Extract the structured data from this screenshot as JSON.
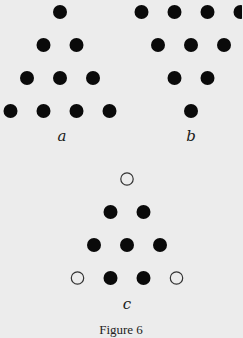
{
  "figure": {
    "caption": "Figure 6",
    "colors": {
      "filled": "#0a0a0a",
      "open_stroke": "#333333",
      "open_fill": "#ececec"
    },
    "panels": [
      {
        "id": "a",
        "label": "a",
        "description": "Triangle of 10 filled dots, apex up (rows of 1,2,3,4)",
        "rows": [
          [
            "filled"
          ],
          [
            "filled",
            "filled"
          ],
          [
            "filled",
            "filled",
            "filled"
          ],
          [
            "filled",
            "filled",
            "filled",
            "filled"
          ]
        ]
      },
      {
        "id": "b",
        "label": "b",
        "description": "Triangle of 10 filled dots, apex down (rows of 4,3,2,1)",
        "rows": [
          [
            "filled",
            "filled",
            "filled",
            "filled"
          ],
          [
            "filled",
            "filled",
            "filled"
          ],
          [
            "filled",
            "filled"
          ],
          [
            "filled"
          ]
        ]
      },
      {
        "id": "c",
        "label": "c",
        "description": "Triangle of 10 positions with 3 corner dots open and 7 filled",
        "rows": [
          [
            "open"
          ],
          [
            "filled",
            "filled"
          ],
          [
            "filled",
            "filled",
            "filled"
          ],
          [
            "open",
            "filled",
            "filled",
            "open"
          ]
        ]
      }
    ]
  }
}
